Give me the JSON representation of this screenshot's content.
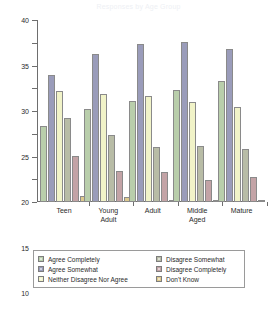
{
  "chart_data": {
    "type": "bar",
    "title": "Responses by Age Group",
    "xlabel": "",
    "ylabel": "",
    "ylim": [
      0,
      40
    ],
    "yticks": [
      0,
      5,
      10,
      15,
      20,
      25,
      30,
      35,
      40
    ],
    "ytick_labels": [
      "0",
      "5",
      "10",
      "15",
      "20",
      "25",
      "30",
      "35",
      "40"
    ],
    "grid": false,
    "legend_position": "bottom",
    "legend_columns": 2,
    "categories": [
      "Teen",
      "Young\nAdult",
      "Adult",
      "Middle\nAged",
      "Mature"
    ],
    "series": [
      {
        "name": "Agree Completely",
        "color": "#b9ceab",
        "values": [
          16.7,
          20.5,
          22.2,
          24.6,
          26.5
        ]
      },
      {
        "name": "Agree Somewhat",
        "color": "#9a9cba",
        "values": [
          28.0,
          32.6,
          34.8,
          35.1,
          33.7
        ]
      },
      {
        "name": "Neither Disagree Nor Agree",
        "color": "#f1f3c8",
        "values": [
          24.5,
          23.7,
          23.2,
          21.9,
          20.9
        ]
      },
      {
        "name": "Disagree Somewhat",
        "color": "#b8bca6",
        "values": [
          18.4,
          14.8,
          12.0,
          12.3,
          11.6
        ]
      },
      {
        "name": "Disagree Completely",
        "color": "#c3a3a6",
        "values": [
          10.2,
          6.9,
          6.5,
          4.9,
          5.6
        ]
      },
      {
        "name": "Don't Know",
        "color": "#ddc98d",
        "values": [
          1.4,
          1.0,
          0.5,
          0.2,
          0.4
        ]
      }
    ]
  },
  "legend": {
    "left_column": [
      "Agree Completely",
      "Agree Somewhat",
      "Neither Disagree Nor Agree"
    ],
    "right_column": [
      "Disagree Somewhat",
      "Disagree Completely",
      "Don't Know"
    ]
  }
}
